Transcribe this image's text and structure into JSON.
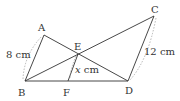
{
  "diagram": {
    "points": {
      "A": {
        "label": "A",
        "x": 44,
        "y": 35
      },
      "B": {
        "label": "B",
        "x": 25,
        "y": 81
      },
      "C": {
        "label": "C",
        "x": 154,
        "y": 16
      },
      "D": {
        "label": "D",
        "x": 128,
        "y": 81
      },
      "E": {
        "label": "E",
        "x": 78,
        "y": 54
      },
      "F": {
        "label": "F",
        "x": 68,
        "y": 81
      }
    },
    "segments": [
      "AB",
      "AD",
      "BC",
      "BD",
      "CD",
      "EF"
    ],
    "measurements": {
      "AB": "8 cm",
      "CD": "12 cm",
      "EF_var": "x",
      "EF_unit": " cm"
    }
  }
}
